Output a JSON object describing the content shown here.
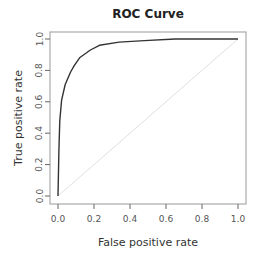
{
  "chart_data": {
    "type": "line",
    "title": "ROC Curve",
    "xlabel": "False positive rate",
    "ylabel": "True positive rate",
    "xlim": [
      0,
      1
    ],
    "ylim": [
      0,
      1
    ],
    "xticks": [
      "0.0",
      "0.2",
      "0.4",
      "0.6",
      "0.8",
      "1.0"
    ],
    "yticks": [
      "0.0",
      "0.2",
      "0.4",
      "0.6",
      "0.8",
      "1.0"
    ],
    "grid": false,
    "legend": null,
    "series": [
      {
        "name": "ROC",
        "color": "#333333",
        "x": [
          0.0,
          0.005,
          0.01,
          0.02,
          0.04,
          0.07,
          0.09,
          0.12,
          0.18,
          0.23,
          0.34,
          0.48,
          0.65,
          1.0
        ],
        "y": [
          0.0,
          0.29,
          0.48,
          0.61,
          0.71,
          0.79,
          0.83,
          0.88,
          0.93,
          0.96,
          0.98,
          0.99,
          1.0,
          1.0
        ]
      },
      {
        "name": "Chance diagonal",
        "color": "#e0e0e0",
        "x": [
          0,
          1
        ],
        "y": [
          0,
          1
        ]
      }
    ]
  }
}
